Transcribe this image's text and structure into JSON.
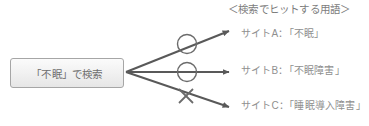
{
  "diagram": {
    "header": {
      "text": "＜検索でヒットする用語＞"
    },
    "query_box": {
      "label": "「不眠」で検索"
    },
    "results": [
      {
        "label": "サイトA：「不眠」",
        "marker": "circle-mark",
        "marker_meaning": "hit"
      },
      {
        "label": "サイトB：「不眠障害」",
        "marker": "circle-mark",
        "marker_meaning": "hit"
      },
      {
        "label": "サイトC：「睡眠導入障害」",
        "marker": "cross-mark",
        "marker_meaning": "no-hit"
      }
    ],
    "colors": {
      "arrow": "#595959",
      "marker": "#6b6b6b",
      "text": "#8f8f8f",
      "box_border": "#a6a6a6",
      "background": "#ffffff"
    }
  }
}
